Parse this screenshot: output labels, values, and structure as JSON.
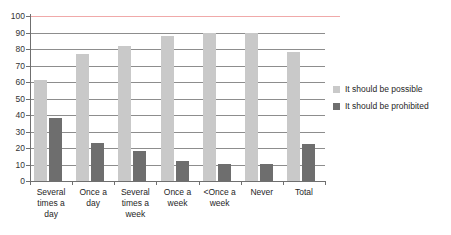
{
  "chart_data": {
    "type": "bar",
    "title": "",
    "subtitle": "",
    "xlabel": "",
    "ylabel": "",
    "ylim": [
      0,
      100
    ],
    "ytick_labels": [
      "100",
      "90",
      "80",
      "70",
      "60",
      "50",
      "40",
      "30",
      "20",
      "10",
      "0"
    ],
    "ytick_values": [
      100,
      90,
      80,
      70,
      60,
      50,
      40,
      30,
      20,
      10,
      0
    ],
    "grid": true,
    "legend_position": "right",
    "categories": [
      "Several times a day",
      "Once a day",
      "Several times a week",
      "Once a week",
      "<Once a week",
      "Never",
      "Total"
    ],
    "category_label_lines": [
      [
        "Several",
        "times a",
        "day"
      ],
      [
        "Once a",
        "day"
      ],
      [
        "Several",
        "times a",
        "week"
      ],
      [
        "Once a",
        "week"
      ],
      [
        "<Once a",
        "week"
      ],
      [
        "Never"
      ],
      [
        "Total"
      ]
    ],
    "series": [
      {
        "name": "It should be possible",
        "color": "#c9c9c9",
        "values": [
          61,
          77,
          82,
          88,
          90,
          90,
          78
        ]
      },
      {
        "name": "It should be prohibited",
        "color": "#6e6e6e",
        "values": [
          38,
          23,
          18,
          12,
          10.5,
          10.5,
          22.5
        ]
      }
    ],
    "annotations": [
      {
        "name": "top-reference-line",
        "value": 100,
        "color": "#f0a9a9"
      }
    ]
  },
  "legend": {
    "items": [
      {
        "label": "It should be possible",
        "color": "#c9c9c9"
      },
      {
        "label": "It should be prohibited",
        "color": "#6e6e6e"
      }
    ]
  },
  "colors": {
    "possible": "#c9c9c9",
    "prohibited": "#6e6e6e",
    "grid": "#8d8d8d",
    "axis": "#6f6f6f",
    "reference_line": "#f0a9a9",
    "background": "#ffffff",
    "text": "#262626"
  }
}
